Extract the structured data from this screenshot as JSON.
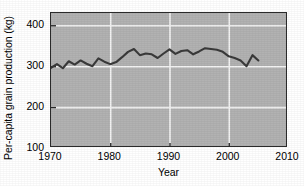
{
  "chart_data": {
    "type": "line",
    "title": "",
    "xlabel": "Year",
    "ylabel": "Per-capita grain production (kg)",
    "xlim": [
      1970,
      2010
    ],
    "ylim": [
      100,
      430
    ],
    "xticks": [
      1970,
      1980,
      1990,
      2000,
      2010
    ],
    "yticks": [
      100,
      200,
      300,
      400
    ],
    "grid": true,
    "legend": "none",
    "line_color": "#3a3a3a",
    "plot_background": "#b2b2b2",
    "gridline_color": "#f2f2f2",
    "axis_color": "#2b2b2b",
    "series": [
      {
        "name": "Per-capita grain production",
        "x": [
          1970,
          1971,
          1972,
          1973,
          1974,
          1975,
          1976,
          1977,
          1978,
          1979,
          1980,
          1981,
          1982,
          1983,
          1984,
          1985,
          1986,
          1987,
          1988,
          1989,
          1990,
          1991,
          1992,
          1993,
          1994,
          1995,
          1996,
          1997,
          1998,
          1999,
          2000,
          2001,
          2002,
          2003,
          2004,
          2005
        ],
        "values": [
          296,
          305,
          295,
          312,
          304,
          314,
          306,
          300,
          319,
          311,
          305,
          310,
          322,
          335,
          342,
          327,
          331,
          329,
          320,
          331,
          341,
          330,
          337,
          339,
          329,
          336,
          344,
          342,
          340,
          335,
          324,
          320,
          314,
          300,
          327,
          314
        ]
      }
    ]
  }
}
